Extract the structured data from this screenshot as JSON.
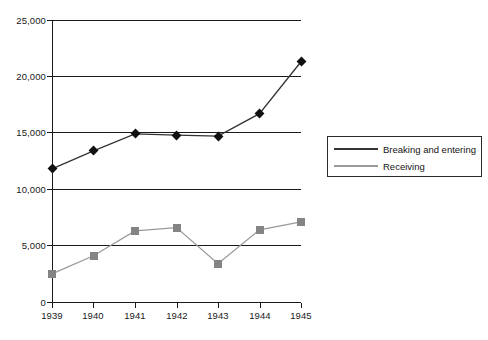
{
  "chart_data": {
    "type": "line",
    "title": "",
    "xlabel": "",
    "ylabel": "",
    "categories": [
      "1939",
      "1940",
      "1941",
      "1942",
      "1943",
      "1944",
      "1945"
    ],
    "x": [
      1939,
      1940,
      1941,
      1942,
      1943,
      1944,
      1945
    ],
    "ylim": [
      0,
      25000
    ],
    "xlim": [
      1939,
      1945
    ],
    "yticks": [
      0,
      5000,
      10000,
      15000,
      20000,
      25000
    ],
    "ytick_labels": [
      "0",
      "5,000",
      "10,000",
      "15,000",
      "20,000",
      "25,000"
    ],
    "grid": true,
    "grid_axis": "y",
    "legend_position": "right",
    "series": [
      {
        "name": "Breaking and entering",
        "marker": "diamond",
        "color": "#111111",
        "line_color": "#333333",
        "values": [
          11800,
          13400,
          14900,
          14800,
          14700,
          16700,
          21300
        ]
      },
      {
        "name": "Receiving",
        "marker": "square",
        "color": "#848484",
        "line_color": "#9a9a9a",
        "values": [
          2500,
          4100,
          6300,
          6600,
          3400,
          6400,
          7100
        ]
      }
    ]
  },
  "legend": {
    "items": [
      {
        "label": "Breaking and entering"
      },
      {
        "label": "Receiving"
      }
    ]
  },
  "axis": {
    "y_labels": [
      "25,000",
      "20,000",
      "15,000",
      "10,000",
      "5,000",
      "0"
    ],
    "x_labels": [
      "1939",
      "1940",
      "1941",
      "1942",
      "1943",
      "1944",
      "1945"
    ]
  }
}
